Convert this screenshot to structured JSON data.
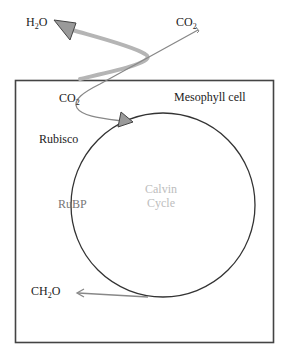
{
  "diagram": {
    "labels": {
      "h2o": {
        "main": "H",
        "sub": "2",
        "tail": "O"
      },
      "co2_outside": {
        "main": "CO",
        "sub": "2"
      },
      "co2_inside": {
        "main": "CO",
        "sub": "2"
      },
      "mesophyll": "Mesophyll cell",
      "rubisco": "Rubisco",
      "rubp": "RuBP",
      "calvin_line1": "Calvin",
      "calvin_line2": "Cycle",
      "ch2o": {
        "main": "CH",
        "sub": "2",
        "tail": "O"
      }
    },
    "colors": {
      "cell_border": "#444444",
      "cycle_circle": "#333333",
      "h2o_path": "#b5b5b5",
      "co2_path": "#888888",
      "arrowhead_fill": "#9a9a9a",
      "calvin_text": "#bdbdbd",
      "rubp_text": "#777777"
    },
    "shapes": {
      "cell_box": {
        "x": 15,
        "y": 80,
        "width": 258,
        "height": 262
      },
      "calvin_circle": {
        "cx": 163,
        "cy": 205,
        "r": 92
      }
    }
  }
}
